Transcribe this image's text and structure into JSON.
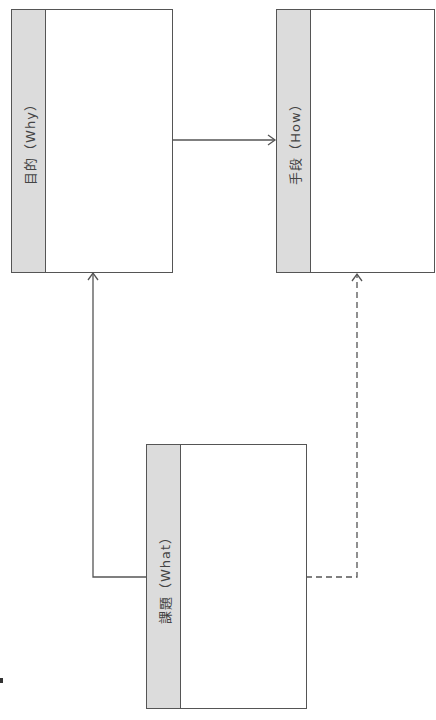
{
  "diagram": {
    "boxes": [
      {
        "id": "why",
        "label": "目的（Why）",
        "content": ""
      },
      {
        "id": "how",
        "label": "手段（How）",
        "content": ""
      },
      {
        "id": "what",
        "label": "課題（What）",
        "content": ""
      }
    ],
    "connections": [
      {
        "from": "why",
        "to": "how",
        "style": "solid",
        "arrow": "end"
      },
      {
        "from": "what",
        "to": "why",
        "style": "solid",
        "arrow": "end"
      },
      {
        "from": "what",
        "to": "how",
        "style": "dashed",
        "arrow": "end"
      }
    ],
    "colors": {
      "header_fill": "#dcdcdc",
      "border": "#555555",
      "text": "#444444"
    }
  }
}
